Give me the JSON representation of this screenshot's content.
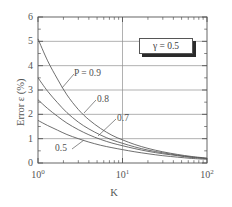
{
  "chart_data": {
    "type": "line",
    "title": "",
    "xlabel": "K",
    "ylabel": "Error ε  (%)",
    "xscale": "log",
    "yscale": "linear",
    "xlim": [
      1,
      100
    ],
    "ylim": [
      0,
      6
    ],
    "grid": true,
    "grid_lines_y": [
      1,
      2,
      3,
      4,
      5
    ],
    "grid_lines_x": [
      10
    ],
    "xticks": [
      {
        "value": 1,
        "label": "10",
        "exponent": "0"
      },
      {
        "value": 10,
        "label": "10",
        "exponent": "1"
      },
      {
        "value": 100,
        "label": "10",
        "exponent": "2"
      }
    ],
    "yticks": [
      {
        "value": 0,
        "label": "0"
      },
      {
        "value": 1,
        "label": "1"
      },
      {
        "value": 2,
        "label": "2"
      },
      {
        "value": 3,
        "label": "3"
      },
      {
        "value": 4,
        "label": "4"
      },
      {
        "value": 5,
        "label": "5"
      },
      {
        "value": 6,
        "label": "6"
      }
    ],
    "annotations": [
      {
        "name": "gamma-legend",
        "text": "γ = 0.5"
      },
      {
        "name": "curve-label-p09",
        "text": "P = 0.9"
      },
      {
        "name": "curve-label-p08",
        "text": "0.8"
      },
      {
        "name": "curve-label-p07",
        "text": "0.7"
      },
      {
        "name": "curve-label-p05",
        "text": "0.5"
      }
    ],
    "series": [
      {
        "name": "P = 0.9",
        "color": "#555555",
        "x": [
          1,
          1.3,
          1.7,
          2.2,
          3,
          4,
          5.5,
          7.5,
          10,
          14,
          20,
          30,
          45,
          65,
          100
        ],
        "y": [
          5.1,
          4.2,
          3.45,
          2.8,
          2.2,
          1.78,
          1.42,
          1.14,
          0.95,
          0.76,
          0.6,
          0.46,
          0.35,
          0.27,
          0.2
        ]
      },
      {
        "name": "0.8",
        "color": "#555555",
        "x": [
          1,
          1.3,
          1.7,
          2.2,
          3,
          4,
          5.5,
          7.5,
          10,
          14,
          20,
          30,
          45,
          65,
          100
        ],
        "y": [
          3.5,
          2.95,
          2.48,
          2.07,
          1.68,
          1.4,
          1.15,
          0.95,
          0.81,
          0.66,
          0.53,
          0.42,
          0.32,
          0.25,
          0.19
        ]
      },
      {
        "name": "0.7",
        "color": "#555555",
        "x": [
          1,
          1.3,
          1.7,
          2.2,
          3,
          4,
          5.5,
          7.5,
          10,
          14,
          20,
          30,
          45,
          65,
          100
        ],
        "y": [
          2.6,
          2.24,
          1.92,
          1.64,
          1.37,
          1.16,
          0.97,
          0.82,
          0.71,
          0.59,
          0.48,
          0.38,
          0.3,
          0.23,
          0.18
        ]
      },
      {
        "name": "0.5",
        "color": "#555555",
        "x": [
          1,
          1.3,
          1.7,
          2.2,
          3,
          4,
          5.5,
          7.5,
          10,
          14,
          20,
          30,
          45,
          65,
          100
        ],
        "y": [
          1.75,
          1.54,
          1.35,
          1.17,
          1.0,
          0.86,
          0.73,
          0.63,
          0.55,
          0.46,
          0.38,
          0.3,
          0.24,
          0.19,
          0.15
        ]
      }
    ]
  },
  "colors": {
    "axis": "#555555",
    "grid": "#8f8f8f",
    "curve": "#555555",
    "legend_border": "#565656",
    "legend_shadow": "#2b2b2b",
    "text": "#555555",
    "background": "#ffffff"
  }
}
